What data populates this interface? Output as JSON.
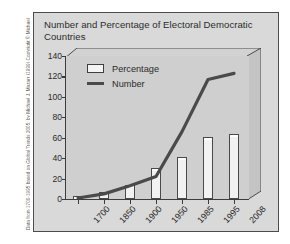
{
  "credit": {
    "text": "Data from 1700-1995 based on Global Trends 2005, by Michael J. Mazarr (1999) Copyright © Michael J. Mazarr. Reprinted with permission of Palgrave Macmillan. Data from 1995-2008 based on Freedom House."
  },
  "panel": {
    "title": "Number and Percentage of Electoral Democratic Countries"
  },
  "legend": {
    "items": [
      {
        "label": "Percentage",
        "marker": "bar-swatch",
        "color": "#f4f4f4"
      },
      {
        "label": "Number",
        "marker": "line-swatch",
        "color": "#4a4a4a"
      }
    ]
  },
  "colors": {
    "panel_background": "#d9d9d9",
    "plot_background": "#cfcfcf",
    "axis": "#3c3c3c",
    "bar_fill": "#f2f2f2",
    "bar_stroke": "#4a4a4a",
    "line": "#4a4a4a",
    "text": "#2b2b2b",
    "border": "#4c4c4c"
  },
  "chart_data": {
    "type": "bar",
    "title": "Number and Percentage of Electoral Democratic Countries",
    "xlabel": "",
    "ylabel": "",
    "categories": [
      "1700",
      "1850",
      "1900",
      "1950",
      "1985",
      "1995",
      "2008"
    ],
    "ylim": [
      0,
      140
    ],
    "yticks": [
      0,
      20,
      40,
      60,
      80,
      100,
      120,
      140
    ],
    "grid": false,
    "legend_position": "top-left-inside",
    "series": [
      {
        "name": "Percentage",
        "type": "bar",
        "values": [
          3,
          7,
          14,
          30,
          41,
          61,
          64
        ]
      },
      {
        "name": "Number",
        "type": "line",
        "values": [
          1,
          5,
          13,
          22,
          66,
          117,
          123
        ]
      }
    ]
  }
}
